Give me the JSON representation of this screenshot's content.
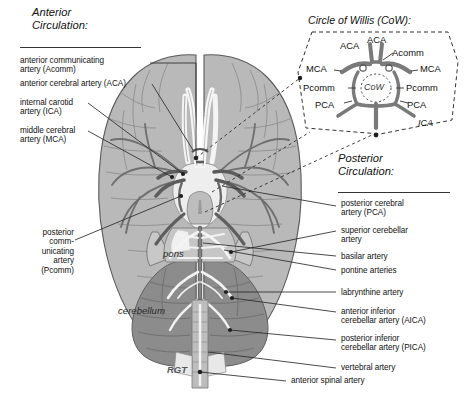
{
  "figure": {
    "title_anterior": "Anterior\nCirculation:",
    "title_posterior": "Posterior\nCirculation:",
    "signature": "RGT",
    "colors": {
      "cortex_fill": "#b4b4b4",
      "cortex_fill_light": "#c4c4c4",
      "cerebellum_fill": "#8d8d8d",
      "brainstem_fill": "#a0a0a0",
      "artery_stroke": "#6f6f6f",
      "artery_dark": "#4d4d4d",
      "vessel_white": "#f2f2f2",
      "outline": "#4a4a4a",
      "leader_line": "#2b2b2b",
      "text": "#111111"
    }
  },
  "anterior_labels": [
    {
      "text": "anterior communicating\nartery (Acomm)",
      "id": "acomm"
    },
    {
      "text": "anterior cerebral artery (ACA)",
      "id": "aca"
    },
    {
      "text": "internal carotid\nartery (ICA)",
      "id": "ica"
    },
    {
      "text": "middle cerebral\nartery (MCA)",
      "id": "mca"
    }
  ],
  "left_lower_label": {
    "text": "posterior\ncomm-\nunicating\nartery\n(Pcomm)",
    "id": "pcomm"
  },
  "posterior_labels": [
    {
      "text": "posterior cerebral\nartery (PCA)",
      "id": "pca"
    },
    {
      "text": "superior cerebellar\nartery",
      "id": "sca"
    },
    {
      "text": "basilar artery",
      "id": "basilar"
    },
    {
      "text": "pontine arteries",
      "id": "pontine"
    },
    {
      "text": "labrynthine artery",
      "id": "labyrinthine"
    },
    {
      "text": "anterior inferior\ncerebellar artery (AICA)",
      "id": "aica"
    },
    {
      "text": "posterior inferior\ncerebellar artery (PICA)",
      "id": "pica"
    },
    {
      "text": "vertebral artery",
      "id": "vertebral"
    },
    {
      "text": "anterior spinal artery",
      "id": "spinal"
    }
  ],
  "anatomy_labels": [
    {
      "text": "pons",
      "id": "pons"
    },
    {
      "text": "cerebellum",
      "id": "cerebellum"
    }
  ],
  "inset": {
    "title": "Circle of Willis (CoW):",
    "center_label": "CoW",
    "labels": [
      {
        "text": "ACA",
        "id": "aca-left"
      },
      {
        "text": "ACA",
        "id": "aca-right"
      },
      {
        "text": "Acomm",
        "id": "acomm"
      },
      {
        "text": "MCA",
        "id": "mca-left"
      },
      {
        "text": "MCA",
        "id": "mca-right"
      },
      {
        "text": "Pcomm",
        "id": "pcomm-left"
      },
      {
        "text": "Pcomm",
        "id": "pcomm-right"
      },
      {
        "text": "PCA",
        "id": "pca-left"
      },
      {
        "text": "PCA",
        "id": "pca-right"
      },
      {
        "text": "ICA",
        "id": "ica"
      }
    ]
  }
}
